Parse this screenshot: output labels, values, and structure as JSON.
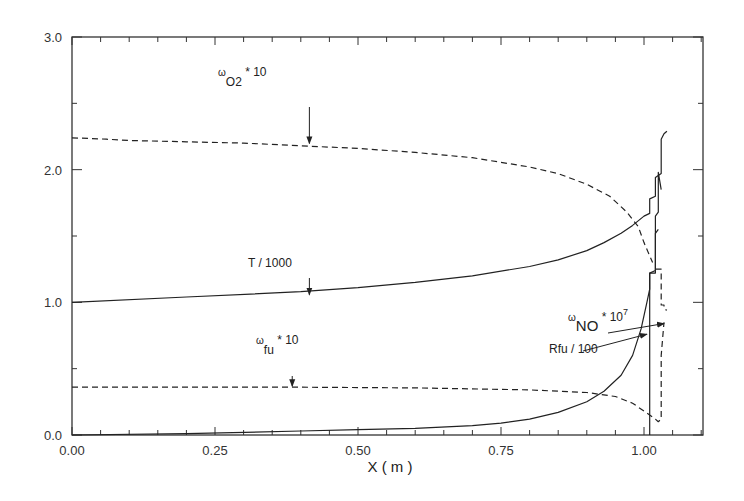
{
  "chart_data": {
    "type": "line",
    "title": "",
    "xlabel": "X ( m )",
    "ylabel": "",
    "xlim": [
      0,
      1.105
    ],
    "ylim": [
      0,
      3.0
    ],
    "grid": false,
    "x_ticks": [
      {
        "value": 0.0,
        "label": "0.00"
      },
      {
        "value": 0.25,
        "label": "0.25"
      },
      {
        "value": 0.5,
        "label": "0.50"
      },
      {
        "value": 0.75,
        "label": "0.75"
      },
      {
        "value": 1.0,
        "label": "1.00"
      }
    ],
    "y_ticks": [
      {
        "value": 0.0,
        "label": "0.0"
      },
      {
        "value": 1.0,
        "label": "1.0"
      },
      {
        "value": 2.0,
        "label": "2.0"
      },
      {
        "value": 3.0,
        "label": "3.0"
      }
    ],
    "series": [
      {
        "name": "omega_O2 * 10",
        "style": "dashed",
        "x": [
          0,
          0.06,
          0.1,
          0.2,
          0.3,
          0.4,
          0.5,
          0.6,
          0.7,
          0.8,
          0.85,
          0.9,
          0.94,
          0.97,
          0.99,
          1.0,
          1.01,
          1.015
        ],
        "y": [
          2.24,
          2.23,
          2.22,
          2.21,
          2.2,
          2.18,
          2.16,
          2.13,
          2.09,
          2.02,
          1.97,
          1.89,
          1.8,
          1.68,
          1.57,
          1.45,
          1.35,
          1.3
        ]
      },
      {
        "name": "T / 1000",
        "style": "solid",
        "x": [
          0,
          0.2,
          0.4,
          0.5,
          0.6,
          0.7,
          0.8,
          0.85,
          0.9,
          0.93,
          0.96,
          0.98,
          1.0,
          1.01,
          1.01,
          1.02,
          1.02,
          1.03,
          1.03,
          1.035,
          1.035,
          1.04
        ],
        "y": [
          1.0,
          1.04,
          1.08,
          1.11,
          1.15,
          1.2,
          1.27,
          1.32,
          1.39,
          1.45,
          1.52,
          1.58,
          1.65,
          1.67,
          1.78,
          1.8,
          1.94,
          1.97,
          2.23,
          2.27,
          2.27,
          2.29
        ]
      },
      {
        "name": "omega_NO * 10^7",
        "style": "solid",
        "x": [
          1.01,
          1.01,
          1.02,
          1.02,
          1.025,
          1.025,
          1.03
        ],
        "y": [
          0.0,
          1.22,
          1.22,
          1.65,
          1.68,
          1.98,
          1.85
        ]
      },
      {
        "name": "Rfu / 100",
        "style": "solid",
        "x": [
          0,
          0.2,
          0.4,
          0.5,
          0.6,
          0.7,
          0.75,
          0.8,
          0.85,
          0.9,
          0.93,
          0.96,
          0.98,
          0.995,
          1.0,
          1.005,
          1.01,
          1.01,
          1.02,
          1.02,
          1.025
        ],
        "y": [
          0.0,
          0.01,
          0.03,
          0.04,
          0.05,
          0.07,
          0.09,
          0.12,
          0.17,
          0.25,
          0.33,
          0.45,
          0.6,
          0.8,
          0.9,
          1.0,
          1.1,
          1.22,
          1.24,
          1.52,
          1.55
        ]
      },
      {
        "name": "omega_fu * 10",
        "style": "dashed",
        "x": [
          0,
          0.2,
          0.4,
          0.6,
          0.8,
          0.9,
          0.95,
          0.98,
          1.0,
          1.02,
          1.025,
          1.03,
          1.03,
          1.035
        ],
        "y": [
          0.36,
          0.36,
          0.36,
          0.355,
          0.34,
          0.32,
          0.29,
          0.24,
          0.18,
          0.12,
          0.1,
          0.12,
          0.6,
          0.85
        ]
      },
      {
        "name": "omega_O2 tail",
        "style": "dashed",
        "x": [
          1.02,
          1.03,
          1.03,
          1.035,
          1.035,
          1.04
        ],
        "y": [
          1.25,
          1.25,
          0.98,
          0.98,
          0.95,
          0.94
        ]
      }
    ],
    "annotations": [
      {
        "id": "o2",
        "base": "ω",
        "sub": "O2",
        "sup": "",
        "suffix": " * 10",
        "arrow_to": {
          "x": 0.415,
          "y": 2.19
        }
      },
      {
        "id": "t",
        "text": "T / 1000",
        "arrow_to": {
          "x": 0.415,
          "y": 1.05
        }
      },
      {
        "id": "fu",
        "base": "ω",
        "sub": "fu",
        "sup": "",
        "suffix": " * 10",
        "arrow_to": {
          "x": 0.385,
          "y": 0.36
        }
      },
      {
        "id": "no",
        "base": "ω",
        "sub": "NO",
        "sup": "7",
        "suffix": " * 10",
        "arrow_to": {
          "x": 1.035,
          "y": 0.84
        }
      },
      {
        "id": "rfu",
        "text": "Rfu / 100",
        "arrow_to": {
          "x": 1.005,
          "y": 0.76
        }
      }
    ]
  }
}
